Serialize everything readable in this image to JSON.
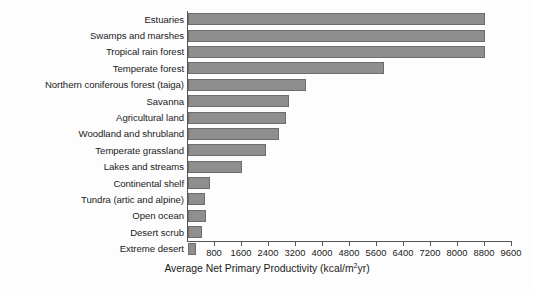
{
  "chart_data": {
    "type": "bar",
    "orientation": "horizontal",
    "title": "",
    "xlabel": "Average Net Primary Productivity (kcal/m2yr)",
    "xlabel_prefix": "Average Net Primary Productivity (kcal/m",
    "xlabel_superscript": "2",
    "xlabel_suffix": "yr)",
    "ylabel": "",
    "xlim": [
      0,
      9600
    ],
    "xtick_step": 800,
    "grid": false,
    "legend": false,
    "bar_color": "#8e8e8e",
    "bar_edge_color": "#6d6d6d",
    "axis_color": "#555555",
    "categories": [
      "Estuaries",
      "Swamps and marshes",
      "Tropical rain forest",
      "Temperate forest",
      "Northern coniferous forest (taiga)",
      "Savanna",
      "Agricultural land",
      "Woodland and shrubland",
      "Temperate grassland",
      "Lakes and streams",
      "Continental shelf",
      "Tundra (artic and alpine)",
      "Open ocean",
      "Desert scrub",
      "Extreme desert"
    ],
    "values": [
      8800,
      8800,
      8800,
      5800,
      3500,
      3000,
      2900,
      2700,
      2300,
      1600,
      650,
      500,
      530,
      420,
      240
    ],
    "xticks": [
      800,
      1600,
      2400,
      3200,
      4000,
      4800,
      5600,
      6400,
      7200,
      8000,
      8800,
      9600
    ],
    "xtick_labels": [
      "800",
      "1600",
      "2400",
      "3200",
      "4000",
      "4800",
      "5600",
      "6400",
      "7200",
      "8000",
      "8800",
      "9600"
    ]
  }
}
